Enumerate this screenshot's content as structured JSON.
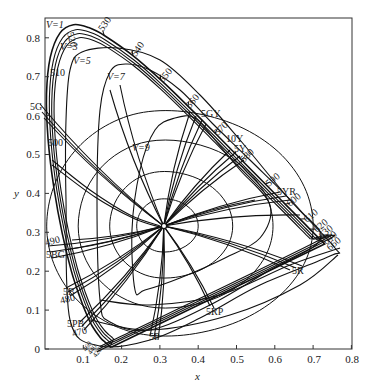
{
  "chart_data": {
    "type": "diagram",
    "xlabel": "x",
    "ylabel": "y",
    "xlim": [
      0,
      0.8
    ],
    "ylim": [
      0,
      0.85
    ],
    "x_ticks": [
      "0.1",
      "0.2",
      "0.3",
      "0.4",
      "0.5",
      "0.6",
      "0.7",
      "0.8"
    ],
    "y_ticks": [
      "0",
      "0.1",
      "0.2",
      "0.3",
      "0.4",
      "0.5",
      "0.6",
      "0.7",
      "0.8"
    ],
    "white_point": {
      "x": 0.31,
      "y": 0.316
    },
    "spectral_locus": [
      {
        "nm": 380,
        "x": 0.1741,
        "y": 0.005
      },
      {
        "nm": 420,
        "x": 0.1714,
        "y": 0.0051
      },
      {
        "nm": 440,
        "x": 0.1644,
        "y": 0.0109
      },
      {
        "nm": 450,
        "x": 0.1566,
        "y": 0.0177
      },
      {
        "nm": 460,
        "x": 0.144,
        "y": 0.0297
      },
      {
        "nm": 470,
        "x": 0.1241,
        "y": 0.0578
      },
      {
        "nm": 475,
        "x": 0.1096,
        "y": 0.0868
      },
      {
        "nm": 480,
        "x": 0.0913,
        "y": 0.1327
      },
      {
        "nm": 485,
        "x": 0.0687,
        "y": 0.2007
      },
      {
        "nm": 490,
        "x": 0.0454,
        "y": 0.295
      },
      {
        "nm": 495,
        "x": 0.0235,
        "y": 0.4127
      },
      {
        "nm": 500,
        "x": 0.0082,
        "y": 0.5384
      },
      {
        "nm": 505,
        "x": 0.0039,
        "y": 0.6548
      },
      {
        "nm": 510,
        "x": 0.0139,
        "y": 0.7502
      },
      {
        "nm": 515,
        "x": 0.0389,
        "y": 0.812
      },
      {
        "nm": 520,
        "x": 0.0743,
        "y": 0.8338
      },
      {
        "nm": 525,
        "x": 0.1142,
        "y": 0.8262
      },
      {
        "nm": 530,
        "x": 0.1547,
        "y": 0.8059
      },
      {
        "nm": 540,
        "x": 0.2296,
        "y": 0.7543
      },
      {
        "nm": 550,
        "x": 0.3016,
        "y": 0.6923
      },
      {
        "nm": 560,
        "x": 0.3731,
        "y": 0.6245
      },
      {
        "nm": 570,
        "x": 0.4441,
        "y": 0.5547
      },
      {
        "nm": 580,
        "x": 0.5125,
        "y": 0.4866
      },
      {
        "nm": 590,
        "x": 0.5752,
        "y": 0.4242
      },
      {
        "nm": 600,
        "x": 0.627,
        "y": 0.3725
      },
      {
        "nm": 610,
        "x": 0.6658,
        "y": 0.334
      },
      {
        "nm": 620,
        "x": 0.6915,
        "y": 0.3083
      },
      {
        "nm": 630,
        "x": 0.7079,
        "y": 0.292
      },
      {
        "nm": 640,
        "x": 0.719,
        "y": 0.2809
      },
      {
        "nm": 660,
        "x": 0.73,
        "y": 0.27
      }
    ],
    "wavelength_labels": [
      {
        "text": "530",
        "x": 0.155,
        "y": 0.806
      },
      {
        "text": "540",
        "x": 0.23,
        "y": 0.754
      },
      {
        "text": "550",
        "x": 0.302,
        "y": 0.692
      },
      {
        "text": "560",
        "x": 0.373,
        "y": 0.624
      },
      {
        "text": "570",
        "x": 0.444,
        "y": 0.555
      },
      {
        "text": "580",
        "x": 0.512,
        "y": 0.487
      },
      {
        "text": "590",
        "x": 0.575,
        "y": 0.424
      },
      {
        "text": "600",
        "x": 0.627,
        "y": 0.373
      },
      {
        "text": "610",
        "x": 0.666,
        "y": 0.334
      },
      {
        "text": "620",
        "x": 0.692,
        "y": 0.308
      },
      {
        "text": "630",
        "x": 0.708,
        "y": 0.292
      },
      {
        "text": "640",
        "x": 0.719,
        "y": 0.281
      },
      {
        "text": "660",
        "x": 0.73,
        "y": 0.27
      },
      {
        "text": "520",
        "x": 0.074,
        "y": 0.834
      },
      {
        "text": "510",
        "x": 0.014,
        "y": 0.75
      },
      {
        "text": "500",
        "x": 0.008,
        "y": 0.538
      },
      {
        "text": "490",
        "x": 0.045,
        "y": 0.295
      },
      {
        "text": "480",
        "x": 0.091,
        "y": 0.133
      },
      {
        "text": "470",
        "x": 0.124,
        "y": 0.058
      },
      {
        "text": "460",
        "x": 0.144,
        "y": 0.03
      },
      {
        "text": "440",
        "x": 0.164,
        "y": 0.011
      },
      {
        "text": "420",
        "x": 0.171,
        "y": 0.005
      }
    ],
    "munsell_hue_labels": [
      "5G",
      "5BG",
      "5B",
      "5PB",
      "5P",
      "5RP",
      "5R",
      "5YR",
      "5Y",
      "10Y",
      "5GY"
    ],
    "value_labels": [
      "V=1",
      "V=3",
      "V=5",
      "V=7",
      "V=9"
    ]
  },
  "labels": {
    "xlabel": "x",
    "ylabel": "y",
    "xticks": [
      "0.1",
      "0.2",
      "0.3",
      "0.4",
      "0.5",
      "0.6",
      "0.7",
      "0.8"
    ],
    "yticks": [
      "0",
      "0.1",
      "0.2",
      "0.3",
      "0.4",
      "0.5",
      "0.6",
      "0.7",
      "0.8"
    ],
    "wl": {
      "w530": "530",
      "w540": "540",
      "w550": "550",
      "w560": "560",
      "w570": "570",
      "w580": "580",
      "w590": "590",
      "w600": "600",
      "w610": "610",
      "w620": "620",
      "w630": "630",
      "w640": "640",
      "w660": "660",
      "w520": "520",
      "w510": "510",
      "w500": "500",
      "w490": "490",
      "w480": "480",
      "w470": "470",
      "w460": "460",
      "w440": "440",
      "w420": "420"
    },
    "hue": {
      "h5G": "5G",
      "h5BG": "5BG",
      "h5B": "5B",
      "h5PB": "5PB",
      "h5P": "5P",
      "h5RP": "5RP",
      "h5R": "5R",
      "h5YR": "5YR",
      "h5Y": "5Y",
      "h10Y": "10Y",
      "h5GY": "5GY"
    },
    "values": {
      "v1": "V=1",
      "v3": "V=3",
      "v5": "V=5",
      "v7": "V=7",
      "v9": "V=9"
    }
  }
}
